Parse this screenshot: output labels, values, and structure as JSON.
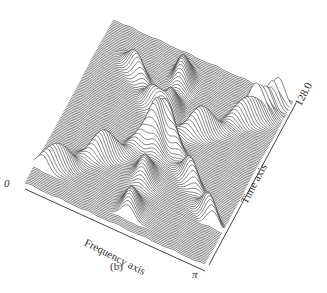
{
  "caption": "(b)",
  "chart_data": {
    "type": "waterfall-3d",
    "title": "",
    "xlabel": "Frequency axis",
    "ylabel": "Time axis",
    "x_ticks": [
      "0",
      "π"
    ],
    "y_ticks": [
      "128.0"
    ],
    "x_range": [
      0,
      3.14159
    ],
    "y_range": [
      0,
      128.0
    ],
    "grid": false,
    "legend": null,
    "n_traces": 120,
    "ridges": [
      {
        "name": "ridge-a",
        "freq_start": 0.05,
        "freq_end": 0.95,
        "time_start": 0.1,
        "time_end": 0.9
      },
      {
        "name": "ridge-b",
        "freq_start": 0.55,
        "freq_end": 0.45,
        "time_start": 0.05,
        "time_end": 0.95
      },
      {
        "name": "ridge-c",
        "freq_start": 0.95,
        "freq_end": 0.15,
        "time_start": 0.2,
        "time_end": 0.85
      },
      {
        "name": "ridge-d",
        "freq_start": 0.85,
        "freq_end": 0.95,
        "time_start": 0.85,
        "time_end": 0.98
      }
    ]
  },
  "labels": {
    "freq_origin": "0",
    "freq_end": "π",
    "freq_axis": "Frequency axis",
    "time_axis": "Time axis",
    "time_max": "128.0"
  }
}
